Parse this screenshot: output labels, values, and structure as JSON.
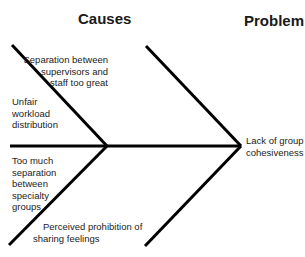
{
  "headings": {
    "causes": "Causes",
    "problem": "Problem"
  },
  "causes": [
    {
      "id": "upper-right",
      "lines": [
        "Separation between",
        "supervisors and",
        "staff too great"
      ]
    },
    {
      "id": "upper-left",
      "lines": [
        "Unfair",
        "workload",
        "distribution"
      ]
    },
    {
      "id": "lower-left",
      "lines": [
        "Too much",
        "separation",
        "between",
        "specialty",
        "groups"
      ]
    },
    {
      "id": "lower-right",
      "lines": [
        "Perceived prohibition of",
        "sharing feelings"
      ]
    }
  ],
  "problem": {
    "lines": [
      "Lack of group",
      "cohesiveness"
    ]
  },
  "colors": {
    "line": "#000000",
    "text": "#222222",
    "background": "#ffffff"
  }
}
